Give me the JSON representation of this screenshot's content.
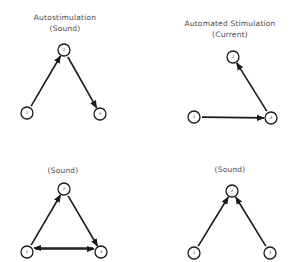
{
  "panels": [
    {
      "id": "top-left",
      "title_lines": [
        "Autostimulation",
        "(Sound)"
      ],
      "title_x": 65,
      "title_y": [
        20,
        31
      ],
      "nodes": [
        {
          "label": "1",
          "x": 27,
          "y": 113
        },
        {
          "label": "2",
          "x": 64,
          "y": 50
        },
        {
          "label": "3",
          "x": 100,
          "y": 114
        }
      ],
      "edges": [
        {
          "from": "1",
          "to": "2"
        },
        {
          "from": "2",
          "to": "3"
        }
      ]
    },
    {
      "id": "top-right",
      "title_lines": [
        "Automated Stimulation",
        "(Current)"
      ],
      "title_x": 230,
      "title_y": [
        26,
        37
      ],
      "nodes": [
        {
          "label": "1",
          "x": 194,
          "y": 117
        },
        {
          "label": "2",
          "x": 233,
          "y": 57
        },
        {
          "label": "3",
          "x": 271,
          "y": 118
        }
      ],
      "edges": [
        {
          "from": "1",
          "to": "3"
        },
        {
          "from": "3",
          "to": "2"
        }
      ]
    },
    {
      "id": "bottom-left",
      "title_lines": [
        "(Sound)"
      ],
      "title_x": 63,
      "title_y": [
        173
      ],
      "nodes": [
        {
          "label": "1",
          "x": 27,
          "y": 252
        },
        {
          "label": "2",
          "x": 64,
          "y": 189
        },
        {
          "label": "3",
          "x": 101,
          "y": 252
        }
      ],
      "edges": [
        {
          "from": "1",
          "to": "2"
        },
        {
          "from": "2",
          "to": "3"
        },
        {
          "from": "1",
          "to": "3",
          "offset": -3
        },
        {
          "from": "3",
          "to": "1",
          "offset": 4
        }
      ]
    },
    {
      "id": "bottom-right",
      "title_lines": [
        "(Sound)"
      ],
      "title_x": 230,
      "title_y": [
        172
      ],
      "nodes": [
        {
          "label": "1",
          "x": 194,
          "y": 253
        },
        {
          "label": "2",
          "x": 232,
          "y": 191
        },
        {
          "label": "3",
          "x": 270,
          "y": 253
        }
      ],
      "edges": [
        {
          "from": "1",
          "to": "2"
        },
        {
          "from": "3",
          "to": "2"
        }
      ]
    }
  ],
  "style": {
    "node_radius": 6,
    "line_color": "#1a1a1a",
    "text_color": "#4a4a4a",
    "background": "#ffffff"
  }
}
